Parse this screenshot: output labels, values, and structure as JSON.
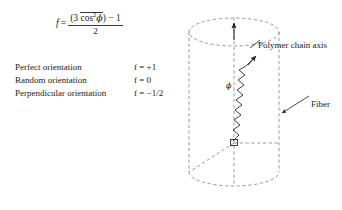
{
  "figure": {
    "formula": {
      "lhs": "f",
      "equals": "=",
      "numerator_open": "(3",
      "numerator_mean": "cos",
      "numerator_exponent": "2",
      "numerator_phi": "ϕ",
      "numerator_close": ")",
      "numerator_minus": "− 1",
      "denominator": "2"
    },
    "orientation_rows": [
      {
        "label": "Perfect orientation",
        "value": "f = +1"
      },
      {
        "label": "Random orientation",
        "value": "f = 0"
      },
      {
        "label": "Perpendicular orientation",
        "value": "f = −1/2"
      }
    ],
    "annotations": {
      "chain_axis": "Polymer chain axis",
      "fiber": "Fiber",
      "angle_symbol": "ϕ"
    },
    "colors": {
      "ink": "#1a1a1a",
      "dashed_line": "#8c8c8c",
      "chain": "#2b2b2b",
      "background": "#ffffff"
    }
  }
}
